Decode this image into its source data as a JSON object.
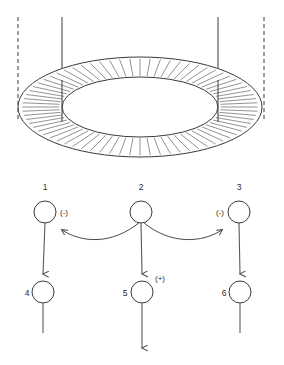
{
  "figure": {
    "width": 284,
    "height": 365,
    "background": "#ffffff",
    "stroke_color": "#3a3a3a",
    "hatch_color": "#777777",
    "connector_color": "#5a5a5a"
  },
  "torus": {
    "name": "hatched-ring",
    "center_x": 140,
    "center_y": 107,
    "outer_rx": 122,
    "outer_ry": 50,
    "inner_rx": 78,
    "inner_ry": 30,
    "hatch_count": 72
  },
  "vertical_lines": [
    {
      "label": "dashed-left",
      "x": 18,
      "y1": 17,
      "y2": 120,
      "style": "dashed"
    },
    {
      "label": "solid-left",
      "x": 62,
      "y1": 17,
      "y2": 122,
      "style": "solid"
    },
    {
      "label": "solid-right",
      "x": 218,
      "y1": 17,
      "y2": 122,
      "style": "solid"
    },
    {
      "label": "dashed-right",
      "x": 264,
      "y1": 17,
      "y2": 120,
      "style": "dashed"
    }
  ],
  "circuit": {
    "top_row": [
      {
        "id": "1",
        "label": "1",
        "cx": 45,
        "cy": 212,
        "r": 11,
        "sign": "(-)",
        "sign_side": "right"
      },
      {
        "id": "2",
        "label": "2",
        "cx": 141,
        "cy": 212,
        "r": 11,
        "sign": "",
        "sign_side": ""
      },
      {
        "id": "3",
        "label": "3",
        "cx": 239,
        "cy": 212,
        "r": 11,
        "sign": "(-)",
        "sign_side": "left"
      }
    ],
    "bottom_row": [
      {
        "id": "4",
        "label": "4",
        "cx": 43,
        "cy": 292,
        "r": 11,
        "sign": "",
        "sign_side": ""
      },
      {
        "id": "5",
        "label": "5",
        "cx": 142,
        "cy": 292,
        "r": 11,
        "sign": "(+)",
        "sign_side": "right"
      },
      {
        "id": "6",
        "label": "6",
        "cx": 240,
        "cy": 292,
        "r": 11,
        "sign": "",
        "sign_side": ""
      }
    ],
    "labels": {
      "one": "1",
      "two": "2",
      "three": "3",
      "four": "4",
      "five": "5",
      "six": "6",
      "minus": "(-)",
      "plus": "(+)"
    },
    "connections": [
      {
        "from": "1",
        "to": "4",
        "type": "straight-arrow"
      },
      {
        "from": "2",
        "to": "5",
        "type": "straight-arrow"
      },
      {
        "from": "3",
        "to": "6",
        "type": "straight-arrow"
      },
      {
        "from": "2",
        "to": "1",
        "type": "curved-arrow-left"
      },
      {
        "from": "2",
        "to": "3",
        "type": "curved-arrow-right"
      },
      {
        "from": "4",
        "to": "out",
        "type": "straight-line"
      },
      {
        "from": "5",
        "to": "out",
        "type": "straight-arrow"
      },
      {
        "from": "6",
        "to": "out",
        "type": "straight-line"
      }
    ]
  }
}
